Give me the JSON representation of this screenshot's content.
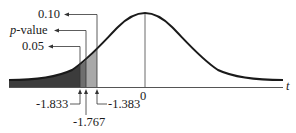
{
  "diagram": {
    "type": "t-distribution-curve",
    "axis": {
      "variable": "t",
      "center_label": "0"
    },
    "left_labels": [
      {
        "text": "0.10",
        "points_to": "-1.383"
      },
      {
        "text_italic": "p",
        "text_rest": "-value",
        "points_to": "-1.767"
      },
      {
        "text": "0.05",
        "points_to": "-1.833"
      }
    ],
    "critical_values": [
      {
        "value": "-1.833"
      },
      {
        "value": "-1.767"
      },
      {
        "value": "-1.383"
      }
    ],
    "colors": {
      "curve": "#1a1a1a",
      "dark_shade": "#3c3c3c",
      "mid_shade": "#6e6e6e",
      "light_shade": "#a8a8a8",
      "axis": "#555555"
    }
  }
}
